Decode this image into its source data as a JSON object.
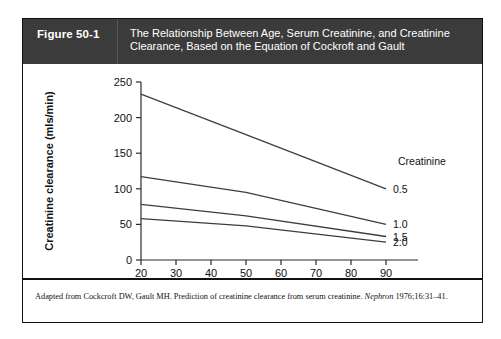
{
  "figure": {
    "number_label": "Figure 50-1",
    "title": "The Relationship Between Age, Serum Creatinine, and Creatinine Clearance, Based on the Equation of Cockroft and Gault",
    "caption_prefix": "Adapted from Cockcroft DW, Gault MH. Prediction of creatinine clearance from serum creatinine. ",
    "caption_journal": "Nephron",
    "caption_suffix": " 1976;16:31–41.",
    "header_bg": "#3b3b3b",
    "border_color": "#111111"
  },
  "chart_data": {
    "type": "line",
    "title": "",
    "xlabel": "Age",
    "ylabel": "Creatinine clearance (mls/min)",
    "xlim": [
      20,
      90
    ],
    "ylim": [
      0,
      250
    ],
    "xticks": [
      20,
      30,
      40,
      50,
      60,
      70,
      80,
      90
    ],
    "xticklabels": [
      "20",
      "30",
      "40",
      "50",
      "60",
      "70",
      "80",
      "90"
    ],
    "yticks": [
      0,
      50,
      100,
      150,
      200,
      250
    ],
    "yticklabels": [
      "0",
      "50",
      "100",
      "150",
      "200",
      "250"
    ],
    "grid": false,
    "legend_position": "right-inside",
    "legend_title": "Creatinine",
    "x": [
      20,
      50,
      90
    ],
    "series": [
      {
        "name": "0.5",
        "values": [
          233,
          176,
          100
        ],
        "color": "#3d3d3d"
      },
      {
        "name": "1.0",
        "values": [
          117,
          95,
          50
        ],
        "color": "#3d3d3d"
      },
      {
        "name": "1.5",
        "values": [
          78,
          62,
          33
        ],
        "color": "#3d3d3d"
      },
      {
        "name": "2.0",
        "values": [
          58,
          48,
          25
        ],
        "color": "#3d3d3d"
      }
    ]
  }
}
